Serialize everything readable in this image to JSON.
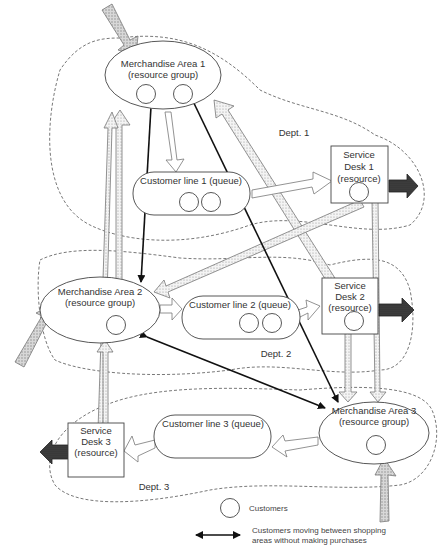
{
  "diagram": {
    "departments": [
      {
        "id": "dept1",
        "label": "Dept. 1"
      },
      {
        "id": "dept2",
        "label": "Dept. 2"
      },
      {
        "id": "dept3",
        "label": "Dept. 3"
      }
    ],
    "nodes": {
      "ma1": {
        "line1": "Merchandise Area 1",
        "line2": "(resource group)",
        "customers": 2
      },
      "ma2": {
        "line1": "Merchandise Area 2",
        "line2": "(resource group)",
        "customers": 1
      },
      "ma3": {
        "line1": "Merchandise Area 3",
        "line2": "(resource group)",
        "customers": 1
      },
      "cl1": {
        "label": "Customer line 1 (queue)",
        "customers": 2
      },
      "cl2": {
        "label": "Customer line 2 (queue)",
        "customers": 2
      },
      "cl3": {
        "label": "Customer line 3 (queue)",
        "customers": 0
      },
      "sd1": {
        "line1": "Service",
        "line2": "Desk 1",
        "line3": "(resource)",
        "customers": 1
      },
      "sd2": {
        "line1": "Service",
        "line2": "Desk 2",
        "line3": "(resource)",
        "customers": 1
      },
      "sd3": {
        "line1": "Service",
        "line2": "Desk 3",
        "line3": "(resource)",
        "customers": 0
      }
    },
    "legend": {
      "customers_label": "Customers",
      "moving_label_line1": "Customers moving between shopping",
      "moving_label_line2": "areas without making purchases"
    },
    "colors": {
      "line": "#111111",
      "dashed_boundary": "#555555",
      "exit_arrow": "#333333",
      "entry_arrow": "#bbbbbb"
    }
  }
}
